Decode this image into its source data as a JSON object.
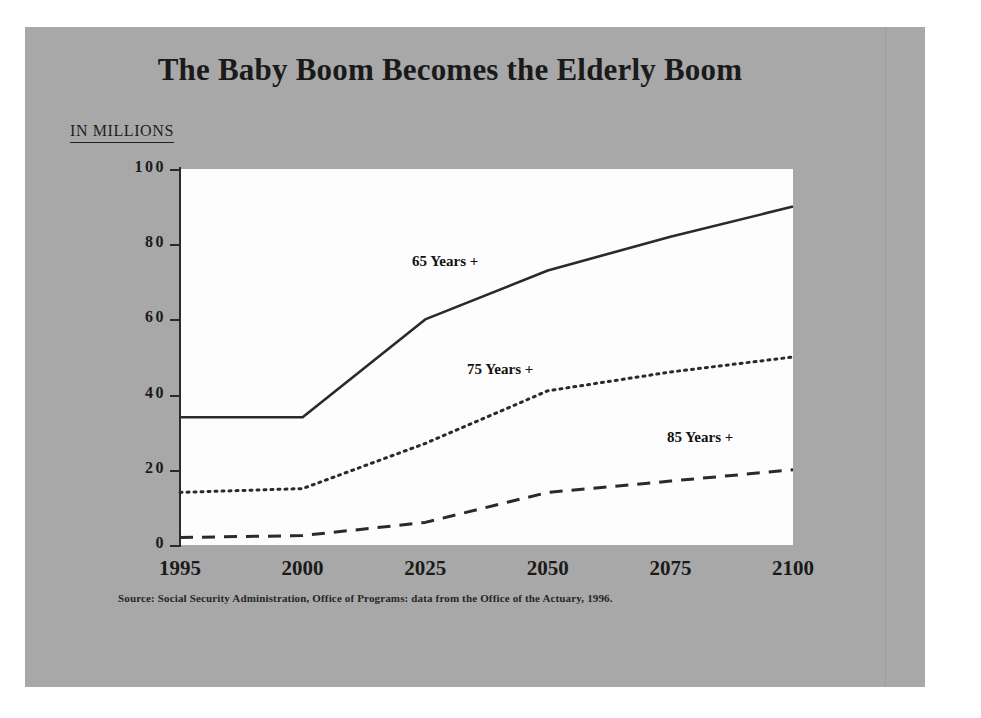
{
  "slide": {
    "title": "The Baby Boom Becomes the Elderly Boom",
    "units_label": "IN MILLIONS",
    "source_note": "Source:  Social Security Administration, Office of Programs:  data from the Office of the Actuary, 1996.",
    "background_color": "#a8a8a8",
    "plot_background_color": "#fdfdfd",
    "ink_color": "#1a1a1a"
  },
  "chart_data": {
    "type": "line",
    "title": "The Baby Boom Becomes the Elderly Boom",
    "xlabel": "",
    "ylabel": "IN MILLIONS",
    "categories": [
      "1995",
      "2000",
      "2025",
      "2050",
      "2075",
      "2100"
    ],
    "x_tick_labels": [
      "1995",
      "2000",
      "2025",
      "2050",
      "2075",
      "2100"
    ],
    "y_tick_labels": [
      "0",
      "20",
      "40",
      "60",
      "80",
      "100"
    ],
    "y_ticks": [
      0,
      20,
      40,
      60,
      80,
      100
    ],
    "ylim": [
      0,
      100
    ],
    "grid": false,
    "legend": "inline-annotations",
    "series": [
      {
        "name": "65 Years +",
        "style": "solid",
        "color": "#2a2a2a",
        "values": [
          34,
          34,
          60,
          73,
          82,
          90
        ]
      },
      {
        "name": "75 Years +",
        "style": "dotted",
        "color": "#2a2a2a",
        "values": [
          14,
          15,
          27,
          41,
          46,
          50
        ]
      },
      {
        "name": "85 Years +",
        "style": "dashed",
        "color": "#2a2a2a",
        "values": [
          2,
          2.5,
          6,
          14,
          17,
          20
        ]
      }
    ],
    "annotations": [
      {
        "text": "65 Years +",
        "x_px": 437,
        "y_px": 280
      },
      {
        "text": "75 Years +",
        "x_px": 492,
        "y_px": 388
      },
      {
        "text": "85 Years +",
        "x_px": 692,
        "y_px": 456
      }
    ]
  }
}
